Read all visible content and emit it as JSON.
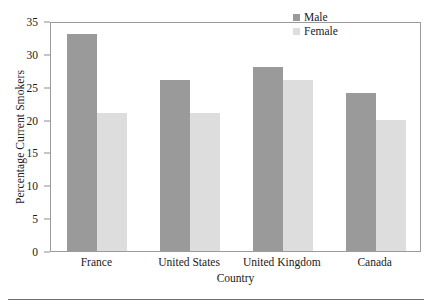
{
  "chart_data": {
    "type": "bar",
    "title": "",
    "xlabel": "Country",
    "ylabel": "Percentage Current Smokers",
    "categories": [
      "France",
      "United States",
      "United Kingdom",
      "Canada"
    ],
    "series": [
      {
        "name": "Male",
        "color": "#9a9a9a",
        "values": [
          33,
          26,
          28,
          24
        ]
      },
      {
        "name": "Female",
        "color": "#dddddd",
        "values": [
          21,
          21,
          26,
          20
        ]
      }
    ],
    "ylim": [
      0,
      35
    ],
    "yticks": [
      0,
      5,
      10,
      15,
      20,
      25,
      30,
      35
    ],
    "grid": false,
    "legend_position": "top-right",
    "frame": true
  },
  "legend": {
    "items": [
      {
        "label": "Male"
      },
      {
        "label": "Female"
      }
    ]
  },
  "axes": {
    "y_title": "Percentage Current Smokers",
    "x_title": "Country"
  }
}
